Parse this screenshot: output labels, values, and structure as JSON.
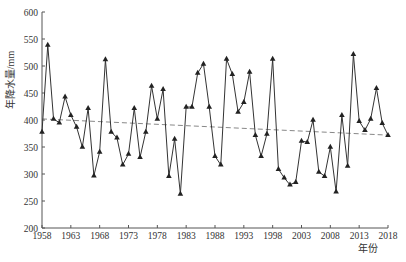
{
  "chart_data": {
    "type": "line",
    "title": "",
    "xlabel": "年份",
    "ylabel": "年降水量/mm",
    "ylim": [
      200,
      600
    ],
    "xlim": [
      1958,
      2018
    ],
    "yticks": [
      200,
      250,
      300,
      350,
      400,
      450,
      500,
      550,
      600
    ],
    "xticks": [
      1958,
      1963,
      1968,
      1973,
      1978,
      1983,
      1988,
      1993,
      1998,
      2003,
      2008,
      2013,
      2018
    ],
    "grid": false,
    "legend": null,
    "x": [
      1958,
      1959,
      1960,
      1961,
      1962,
      1963,
      1964,
      1965,
      1966,
      1967,
      1968,
      1969,
      1970,
      1971,
      1972,
      1973,
      1974,
      1975,
      1976,
      1977,
      1978,
      1979,
      1980,
      1981,
      1982,
      1983,
      1984,
      1985,
      1986,
      1987,
      1988,
      1989,
      1990,
      1991,
      1992,
      1993,
      1994,
      1995,
      1996,
      1997,
      1998,
      1999,
      2000,
      2001,
      2002,
      2003,
      2004,
      2005,
      2006,
      2007,
      2008,
      2009,
      2010,
      2011,
      2012,
      2013,
      2014,
      2015,
      2016,
      2017,
      2018
    ],
    "series": [
      {
        "name": "年降水量",
        "marker": "triangle",
        "color": "#222222",
        "values": [
          378,
          539,
          402,
          395,
          443,
          409,
          387,
          350,
          422,
          297,
          341,
          512,
          378,
          367,
          317,
          337,
          422,
          331,
          378,
          463,
          402,
          457,
          296,
          365,
          263,
          424,
          424,
          487,
          504,
          424,
          333,
          317,
          513,
          485,
          415,
          433,
          489,
          372,
          333,
          374,
          513,
          309,
          293,
          280,
          285,
          361,
          359,
          400,
          304,
          296,
          350,
          267,
          409,
          315,
          522,
          398,
          381,
          402,
          459,
          394,
          372
        ]
      },
      {
        "name": "线性趋势",
        "style": "dashed",
        "color": "#888888",
        "values_at_ends": {
          "1958": 402,
          "2018": 372
        }
      }
    ]
  }
}
